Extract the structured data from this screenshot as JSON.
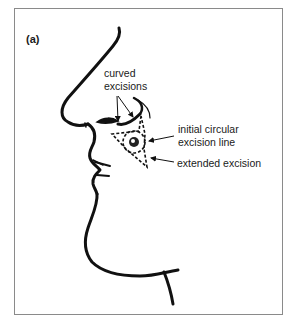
{
  "figure": {
    "panel_label": "(a)",
    "annotations": {
      "curved_excisions": [
        "curved",
        "excisions"
      ],
      "initial_circular": [
        "initial circular",
        "excision line"
      ],
      "extended_excision": "extended excision"
    },
    "colors": {
      "line": "#111111",
      "frame": "#8a8a8a",
      "background": "#ffffff"
    }
  }
}
